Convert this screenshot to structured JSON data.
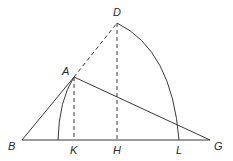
{
  "diagram": {
    "type": "geometric-construction",
    "points": {
      "D": {
        "label": "D",
        "x": 117,
        "y": 23
      },
      "A": {
        "label": "A",
        "x": 74,
        "y": 77
      },
      "B": {
        "label": "B",
        "x": 22,
        "y": 140
      },
      "K": {
        "label": "K",
        "x": 74,
        "y": 140
      },
      "H": {
        "label": "H",
        "x": 117,
        "y": 140
      },
      "L": {
        "label": "L",
        "x": 179,
        "y": 140
      },
      "G": {
        "label": "G",
        "x": 210,
        "y": 140
      }
    },
    "segments": {
      "solid": [
        "BA",
        "AG",
        "BG"
      ],
      "dashed": [
        "AD",
        "AK",
        "DH"
      ]
    },
    "arcs": [
      "D to L (centered near B)",
      "A to baseline (centered near G)"
    ],
    "colors": {
      "stroke": "#3a3a3a",
      "text": "#2a2a2a",
      "background": "#ffffff"
    }
  }
}
